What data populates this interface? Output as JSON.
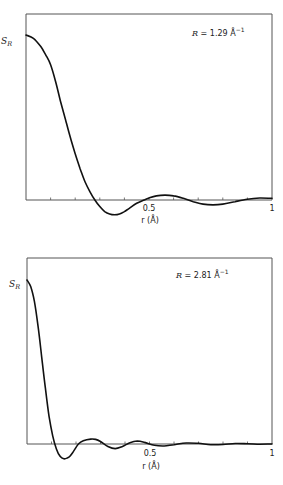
{
  "chart_data": [
    {
      "type": "line",
      "title": "",
      "annotation": "R = 1.29 Å⁻¹",
      "annotation_R": "R",
      "annotation_value": " = 1.29 Å",
      "annotation_exp": "−1",
      "xlabel": "r (Å)",
      "ylabel": "S_R",
      "ylabel_main": "S",
      "ylabel_sub": "R",
      "xlim": [
        0,
        1
      ],
      "ylim": [
        -0.1,
        1.0
      ],
      "xtick_labels": [
        {
          "x": 0.5,
          "label": "0.5"
        },
        {
          "x": 1,
          "label": "1"
        }
      ],
      "minor_ticks": [
        0.1,
        0.2,
        0.3,
        0.4,
        0.5,
        0.6,
        0.7,
        0.8,
        0.9
      ],
      "grid": false,
      "x": [
        0,
        0.03,
        0.06,
        0.08,
        0.1,
        0.12,
        0.14,
        0.16,
        0.18,
        0.2,
        0.22,
        0.24,
        0.26,
        0.28,
        0.3,
        0.32,
        0.34,
        0.36,
        0.38,
        0.4,
        0.42,
        0.45,
        0.48,
        0.5,
        0.53,
        0.565,
        0.6,
        0.64,
        0.68,
        0.72,
        0.76,
        0.8,
        0.85,
        0.9,
        0.95,
        1.0
      ],
      "values": [
        1.0,
        0.98,
        0.93,
        0.88,
        0.82,
        0.72,
        0.6,
        0.49,
        0.38,
        0.28,
        0.19,
        0.11,
        0.05,
        0.0,
        -0.04,
        -0.07,
        -0.085,
        -0.09,
        -0.085,
        -0.07,
        -0.05,
        -0.02,
        0.0,
        0.012,
        0.025,
        0.03,
        0.025,
        0.01,
        -0.01,
        -0.025,
        -0.03,
        -0.025,
        -0.01,
        0.005,
        0.012,
        0.01
      ]
    },
    {
      "type": "line",
      "title": "",
      "annotation": "R = 2.81 Å⁻¹",
      "annotation_R": "R",
      "annotation_value": " = 2.81 Å",
      "annotation_exp": "−1",
      "xlabel": "r (Å)",
      "ylabel": "S_R",
      "ylabel_main": "S",
      "ylabel_sub": "R",
      "xlim": [
        0,
        1
      ],
      "ylim": [
        -0.1,
        1.0
      ],
      "xtick_labels": [
        {
          "x": 0.5,
          "label": "0.5"
        },
        {
          "x": 1,
          "label": "1"
        }
      ],
      "minor_ticks": [
        0.1,
        0.2,
        0.3,
        0.4,
        0.5,
        0.6,
        0.7,
        0.8,
        0.9
      ],
      "grid": false,
      "x": [
        0,
        0.015,
        0.03,
        0.045,
        0.06,
        0.075,
        0.09,
        0.105,
        0.12,
        0.135,
        0.15,
        0.165,
        0.175,
        0.19,
        0.21,
        0.23,
        0.26,
        0.28,
        0.3,
        0.33,
        0.36,
        0.39,
        0.42,
        0.45,
        0.48,
        0.52,
        0.56,
        0.6,
        0.65,
        0.7,
        0.75,
        0.8,
        0.85,
        0.9,
        0.95,
        1.0
      ],
      "values": [
        1.0,
        0.96,
        0.87,
        0.72,
        0.53,
        0.34,
        0.17,
        0.05,
        -0.03,
        -0.075,
        -0.09,
        -0.085,
        -0.075,
        -0.045,
        0.0,
        0.02,
        0.03,
        0.028,
        0.015,
        -0.015,
        -0.028,
        -0.015,
        0.008,
        0.018,
        0.01,
        -0.008,
        -0.012,
        -0.004,
        0.006,
        0.004,
        -0.004,
        -0.003,
        0.003,
        0.002,
        -0.001,
        0.0
      ]
    }
  ],
  "panels": [
    {
      "frame": {
        "left": 26,
        "top": 14,
        "right": 272,
        "baseline": 200,
        "peak_y": 35
      }
    },
    {
      "frame": {
        "left": 27,
        "top": 258,
        "right": 272,
        "baseline": 444,
        "peak_y": 280
      }
    }
  ]
}
